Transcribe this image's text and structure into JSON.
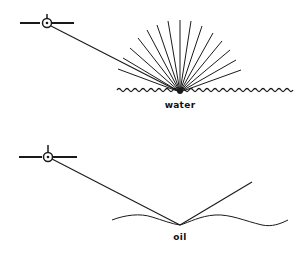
{
  "panels": [
    {
      "id": "water",
      "label": "water",
      "description": "diffuse scattering from rough water surface",
      "satellite": {
        "x": 44,
        "y": 23
      },
      "reflection_point": {
        "x": 180,
        "y": 92
      },
      "label_pos": {
        "x": 180,
        "y": 100
      }
    },
    {
      "id": "oil",
      "label": "oil",
      "description": "specular reflection from smooth oil-covered surface",
      "satellite": {
        "x": 48,
        "y": 156
      },
      "reflection_point": {
        "x": 180,
        "y": 225
      },
      "reflected_ray_end": {
        "x": 252,
        "y": 182
      },
      "label_pos": {
        "x": 180,
        "y": 232
      }
    }
  ],
  "colors": {
    "line": "#1a1a1a",
    "background": "#ffffff"
  }
}
